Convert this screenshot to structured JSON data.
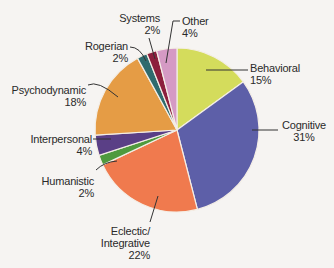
{
  "chart_data": {
    "type": "pie",
    "title": "",
    "start_angle_deg": 0,
    "direction": "clockwise",
    "slices": [
      {
        "label": "Behavioral",
        "value": 15,
        "value_label": "15%",
        "color": "#d4dc5c"
      },
      {
        "label": "Cognitive",
        "value": 31,
        "value_label": "31%",
        "color": "#5d5fa8"
      },
      {
        "label": "Eclectic/ Integrative",
        "value": 22,
        "value_label": "22%",
        "color": "#f07a4e"
      },
      {
        "label": "Humanistic",
        "value": 2,
        "value_label": "2%",
        "color": "#4f9a3e"
      },
      {
        "label": "Interpersonal",
        "value": 4,
        "value_label": "4%",
        "color": "#5a3f86"
      },
      {
        "label": "Psychodynamic",
        "value": 18,
        "value_label": "18%",
        "color": "#e59c45"
      },
      {
        "label": "Rogerian",
        "value": 2,
        "value_label": "2%",
        "color": "#2f6b6e"
      },
      {
        "label": "Systems",
        "value": 2,
        "value_label": "2%",
        "color": "#8c1f3c"
      },
      {
        "label": "Other",
        "value": 4,
        "value_label": "4%",
        "color": "#d59ac4"
      }
    ],
    "center": [
      177,
      130
    ],
    "radius": 82,
    "legend": "none (leader-line labels)"
  },
  "labels": {
    "behavioral": {
      "name": "Behavioral",
      "pct": "15%"
    },
    "cognitive": {
      "name": "Cognitive",
      "pct": "31%"
    },
    "eclectic": {
      "name1": "Eclectic/",
      "name2": "Integrative",
      "pct": "22%"
    },
    "humanistic": {
      "name": "Humanistic",
      "pct": "2%"
    },
    "interpersonal": {
      "name": "Interpersonal",
      "pct": "4%"
    },
    "psychodynamic": {
      "name": "Psychodynamic",
      "pct": "18%"
    },
    "rogerian": {
      "name": "Rogerian",
      "pct": "2%"
    },
    "systems": {
      "name": "Systems",
      "pct": "2%"
    },
    "other": {
      "name": "Other",
      "pct": "4%"
    }
  }
}
